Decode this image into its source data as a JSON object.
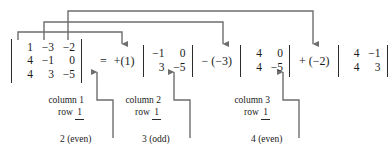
{
  "diagram": {
    "ink_color": "#2a2a2a",
    "connector_color": "#6e6e6e"
  },
  "matrix": {
    "label": "source-determinant",
    "rows": [
      [
        "1",
        "−3",
        "−2"
      ],
      [
        "4",
        "−1",
        "0"
      ],
      [
        "4",
        "3",
        "−5"
      ]
    ]
  },
  "equals": "=",
  "terms": [
    {
      "sign": "+",
      "coefficient": "(1)",
      "sign_and_coefficient": "+(1)",
      "minor": [
        [
          "−1",
          "0"
        ],
        [
          "3",
          "−5"
        ]
      ],
      "caption": {
        "column_label": "column",
        "column_value": "1",
        "row_label": "row",
        "row_value": "1",
        "sum": "2",
        "parity": "(even)",
        "sum_text": "2 (even)"
      }
    },
    {
      "sign": "−",
      "coefficient": "(−3)",
      "sign_and_coefficient": "− (−3)",
      "minor": [
        [
          "4",
          "0"
        ],
        [
          "4",
          "−5"
        ]
      ],
      "caption": {
        "column_label": "column",
        "column_value": "2",
        "row_label": "row",
        "row_value": "1",
        "sum": "3",
        "parity": "(odd)",
        "sum_text": "3 (odd)"
      }
    },
    {
      "sign": "+",
      "coefficient": "(−2)",
      "sign_and_coefficient": "+ (−2)",
      "minor": [
        [
          "4",
          "−1"
        ],
        [
          "4",
          "3"
        ]
      ],
      "caption": {
        "column_label": "column",
        "column_value": "3",
        "row_label": "row",
        "row_value": "1",
        "sum": "4",
        "parity": "(even)",
        "sum_text": "4 (even)"
      }
    }
  ]
}
